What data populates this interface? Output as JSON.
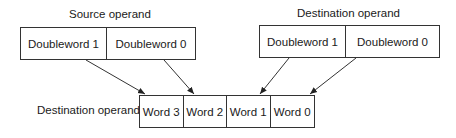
{
  "source": {
    "title": "Source operand",
    "cells": [
      "Doubleword 1",
      "Doubleword 0"
    ]
  },
  "destination": {
    "title": "Destination operand",
    "cells": [
      "Doubleword 1",
      "Doubleword 0"
    ]
  },
  "result": {
    "title": "Destination operand",
    "cells": [
      "Word 3",
      "Word 2",
      "Word 1",
      "Word 0"
    ]
  },
  "arrows": [
    {
      "from": "source.Doubleword 1",
      "to": "result.Word 3"
    },
    {
      "from": "source.Doubleword 0",
      "to": "result.Word 2"
    },
    {
      "from": "destination.Doubleword 1",
      "to": "result.Word 1"
    },
    {
      "from": "destination.Doubleword 0",
      "to": "result.Word 0"
    }
  ]
}
